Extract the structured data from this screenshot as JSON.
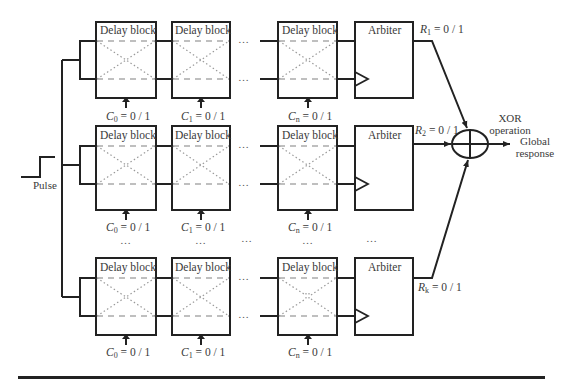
{
  "diagram": {
    "input": {
      "label": "Pulse"
    },
    "block_label": "Delay block",
    "arbiter_label": "Arbiter",
    "rows": [
      {
        "id": "row-1",
        "controls": [
          {
            "sym": "C",
            "sub": "0",
            "val": " = 0 / 1"
          },
          {
            "sym": "C",
            "sub": "1",
            "val": " = 0 / 1"
          },
          {
            "sym": "C",
            "sub": "n",
            "val": " = 0 / 1"
          }
        ],
        "response": {
          "sym": "R",
          "sub": "1",
          "val": " = 0 / 1"
        }
      },
      {
        "id": "row-2",
        "controls": [
          {
            "sym": "C",
            "sub": "0",
            "val": " = 0 / 1"
          },
          {
            "sym": "C",
            "sub": "1",
            "val": " = 0 / 1"
          },
          {
            "sym": "C",
            "sub": "n",
            "val": " = 0 / 1"
          }
        ],
        "response": {
          "sym": "R",
          "sub": "2",
          "val": " = 0 / 1"
        }
      },
      {
        "id": "row-k",
        "controls": [
          {
            "sym": "C",
            "sub": "0",
            "val": " = 0 / 1"
          },
          {
            "sym": "C",
            "sub": "1",
            "val": " = 0 / 1"
          },
          {
            "sym": "C",
            "sub": "n",
            "val": " = 0 / 1"
          }
        ],
        "response": {
          "sym": "R",
          "sub": "k",
          "val": " = 0 / 1"
        }
      }
    ],
    "ellipsis": "…",
    "xor": {
      "line1": "XOR",
      "line2": "operation"
    },
    "output": {
      "line1": "Global",
      "line2": "response"
    },
    "colors": {
      "stroke": "#222222",
      "dashed": "#aaaaaa",
      "dotted": "#999999",
      "text": "#3a3a3a"
    }
  }
}
